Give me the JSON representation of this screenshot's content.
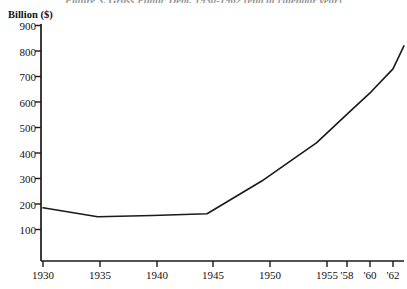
{
  "caption": "Figure 3. Gross Public Debt, 1930-1962 (end of calendar year)",
  "chart_data": {
    "type": "line",
    "title": "Figure 3. Gross Public Debt, 1930-1962 (end of calendar year)",
    "ylabel": "Billion ($)",
    "xlabel": "",
    "ylim": [
      0,
      900
    ],
    "xlim": [
      1930,
      1963
    ],
    "grid": false,
    "legend": null,
    "yticks": [
      100,
      200,
      300,
      400,
      500,
      600,
      700,
      800,
      900
    ],
    "ytick_labels": [
      "100",
      "200",
      "300",
      "400",
      "500",
      "600",
      "700",
      "800",
      "900"
    ],
    "xticks": [
      1930,
      1935,
      1940,
      1945,
      1950,
      1955,
      1958,
      1960,
      1962
    ],
    "xtick_labels": [
      "1930",
      "1935",
      "1940",
      "1945",
      "1950",
      "1955",
      "'58",
      "'60",
      "'62"
    ],
    "x": [
      1930,
      1935,
      1940,
      1945,
      1950,
      1953,
      1955,
      1958,
      1960,
      1962,
      1963
    ],
    "values": [
      185,
      150,
      155,
      162,
      290,
      380,
      440,
      560,
      640,
      730,
      820
    ],
    "series": [
      {
        "name": "Gross Public Debt",
        "x": [
          1930,
          1935,
          1940,
          1945,
          1950,
          1953,
          1955,
          1958,
          1960,
          1962,
          1963
        ],
        "values": [
          185,
          150,
          155,
          162,
          290,
          380,
          440,
          560,
          640,
          730,
          820
        ]
      }
    ],
    "line_color": "#1a1a1a"
  }
}
